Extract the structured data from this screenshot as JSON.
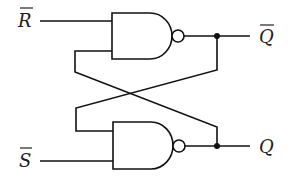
{
  "diagram": {
    "type": "SR latch (NAND)",
    "colors": {
      "line": "#111111",
      "background": "#ffffff"
    },
    "inputs": [
      {
        "id": "r_bar",
        "label": "R",
        "overline": true
      },
      {
        "id": "s_bar",
        "label": "S",
        "overline": true
      }
    ],
    "outputs": [
      {
        "id": "q_bar",
        "label": "Q",
        "overline": true
      },
      {
        "id": "q",
        "label": "Q",
        "overline": false
      }
    ],
    "gates": [
      {
        "id": "nand-top",
        "type": "NAND"
      },
      {
        "id": "nand-bottom",
        "type": "NAND"
      }
    ]
  }
}
